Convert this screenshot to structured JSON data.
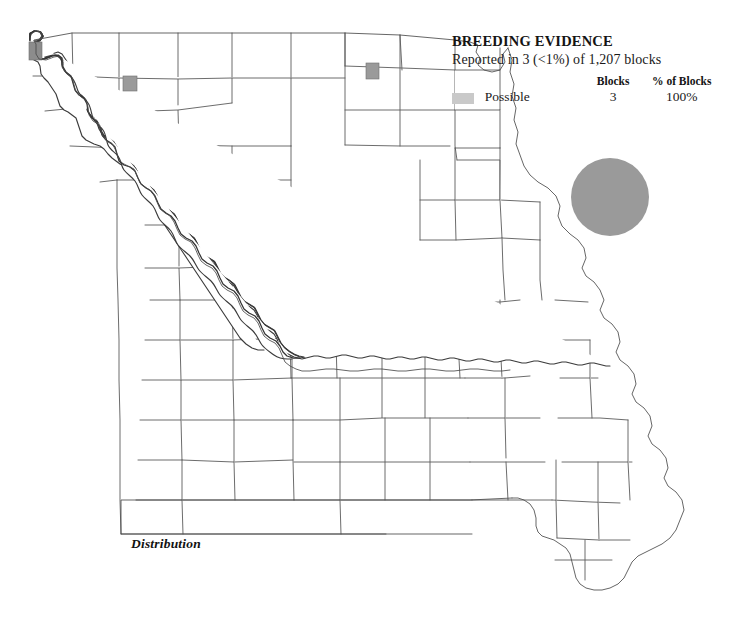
{
  "legend": {
    "title": "BREEDING EVIDENCE",
    "subtitle": "Reported in 3 (<1%) of 1,207 blocks",
    "columns": {
      "swatch": "",
      "category": "",
      "blocks": "Blocks",
      "percent": "% of Blocks"
    },
    "rows": [
      {
        "category": "Possible",
        "blocks": "3",
        "percent": "100%",
        "color": "#c9c9c9"
      }
    ]
  },
  "symbol": {
    "name": "species-symbol-circle",
    "color": "#9a9a9a"
  },
  "caption": {
    "text": "Distribution"
  },
  "map": {
    "name": "missouri-county-map",
    "county_line_color": "#5b5b5b",
    "state_outline_color": "#3b3b3b",
    "background": "#ffffff",
    "reported_blocks": [
      {
        "id": "block-nw-corner",
        "x": 29,
        "y": 42,
        "w": 13,
        "h": 18,
        "color": "#8c8c8c"
      },
      {
        "id": "block-north-west",
        "x": 123,
        "y": 76,
        "w": 14,
        "h": 15,
        "color": "#9a9a9a"
      },
      {
        "id": "block-north-cen",
        "x": 366,
        "y": 63,
        "w": 13,
        "h": 16,
        "color": "#9a9a9a"
      }
    ]
  }
}
